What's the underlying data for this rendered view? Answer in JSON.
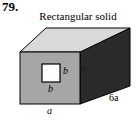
{
  "problem": {
    "number": "79."
  },
  "figure": {
    "title": "Rectangular solid",
    "type": "rectangular-solid-with-square-hole",
    "labels": {
      "hole_width": "b",
      "hole_height": "b",
      "side_height": "a",
      "length": "6a",
      "front_width": "a"
    },
    "label_positions": {
      "hole_width": "below-hole",
      "hole_height": "right-of-hole",
      "side_height": "right-face",
      "length": "bottom-right",
      "front_width": "below-front-face"
    },
    "colors": {
      "top_face": "#d9d9d9",
      "front_face": "#a6a6a6",
      "right_face": "#2b2b2b",
      "hole_fill": "#ffffff",
      "outline": "#000000",
      "background": "#ffffff"
    }
  }
}
